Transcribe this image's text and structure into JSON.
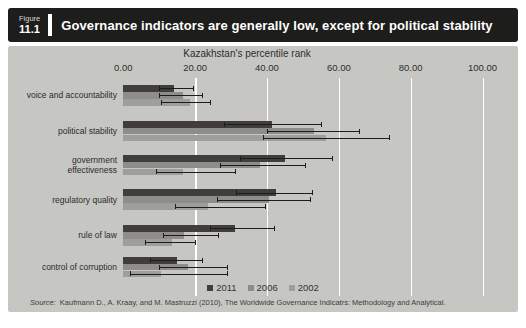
{
  "figure": {
    "label_word": "Figure",
    "number": "11.1",
    "title": "Governance indicators are generally low, except for political stability"
  },
  "chart_data": {
    "type": "bar",
    "orientation": "horizontal",
    "title": "Kazakhstan's percentile rank",
    "xlim": [
      0,
      100
    ],
    "x_ticks": [
      "0.00",
      "20.00",
      "40.00",
      "60.00",
      "80.00",
      "100.00"
    ],
    "x_tick_values": [
      0,
      20,
      40,
      60,
      80,
      100
    ],
    "gridlines": "vertical white lines at 20-unit intervals",
    "legend_position": "bottom-center",
    "categories": [
      "voice and accountability",
      "political stability",
      "government effectiveness",
      "regulatory quality",
      "rule of law",
      "control of corruption"
    ],
    "category_lines": [
      [
        "voice and accountability"
      ],
      [
        "political stability"
      ],
      [
        "government",
        "effectiveness"
      ],
      [
        "regulatory quality"
      ],
      [
        "rule of law"
      ],
      [
        "control of corruption"
      ]
    ],
    "series": [
      {
        "name": "2011",
        "color": "#413d3c",
        "values": [
          14,
          41.5,
          45,
          42.5,
          31,
          15
        ],
        "error_low": [
          10,
          28,
          32.5,
          31.5,
          24,
          7.5
        ],
        "error_high": [
          19.5,
          55,
          58,
          52.5,
          42,
          22
        ]
      },
      {
        "name": "2006",
        "color": "#8d8d8a",
        "values": [
          16.5,
          53,
          38,
          40.5,
          17,
          18
        ],
        "error_low": [
          10,
          40,
          27,
          26,
          11,
          10
        ],
        "error_high": [
          22,
          65.5,
          50.5,
          52,
          26.5,
          29
        ]
      },
      {
        "name": "2002",
        "color": "#9e9e9a",
        "values": [
          18.5,
          56.5,
          16.5,
          23.5,
          13.5,
          10.5
        ],
        "error_low": [
          10.5,
          39,
          9,
          14.5,
          6,
          2
        ],
        "error_high": [
          24,
          74,
          31,
          39.5,
          20,
          29
        ]
      }
    ]
  },
  "source": {
    "prefix": "Source:",
    "text": "Kaufmann D., A. Kraay, and M. Mastruzzi (2010), The Worldwide Governance Indicatrs: Methodology and Analytical."
  },
  "colors": {
    "header_bg": "#1d1d1b",
    "header_text": "#ffffff",
    "chart_bg": "#c6c7c3",
    "gridline": "#ffffff",
    "error_bar": "#1c1c1c",
    "text": "#2e2e2e"
  }
}
